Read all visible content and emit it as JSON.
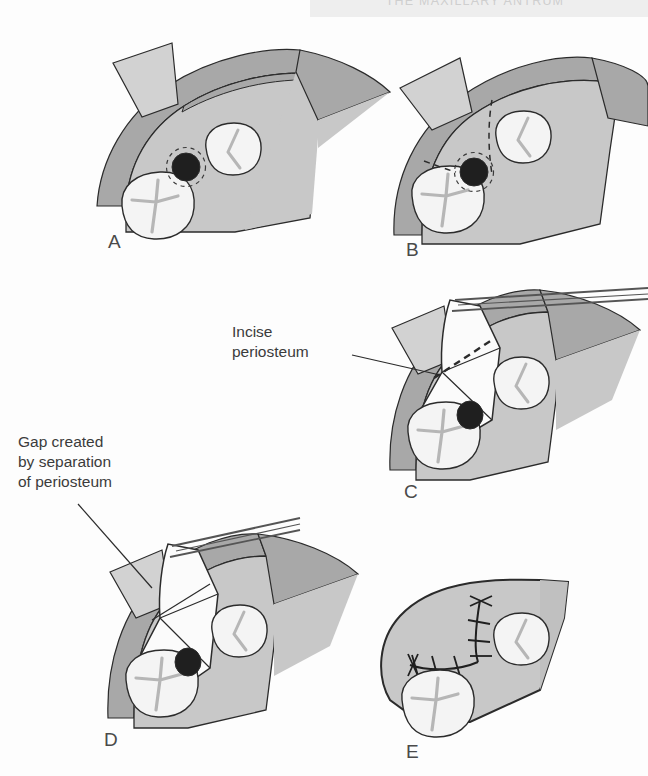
{
  "page": {
    "running_header": "THE MAXILLARY ANTRUM",
    "background_color": "#fdfdfd"
  },
  "colors": {
    "mucosa_light": "#cccccc",
    "mucosa_mid": "#c2c2c2",
    "band_dark": "#a8a8a8",
    "flap_white": "#fbfbfb",
    "tooth_white": "#f4f4f4",
    "socket_dark": "#1f1f1f",
    "outline": "#2b2b2b",
    "instrument": "#555555",
    "text": "#3b3b3b",
    "letter": "#4a4a4a",
    "header_text": "#cfcfcf"
  },
  "figure": {
    "caption_subject": "Buccal advancement flap closure of an oro-antral communication",
    "panels": [
      {
        "id": "A",
        "letter": "A",
        "description": "Oro-antral communication in the edentulous first molar socket, outlined by a dashed circle",
        "features": [
          "alveolar ridge",
          "second molar",
          "premolar",
          "dark socket defect",
          "dashed margin"
        ]
      },
      {
        "id": "B",
        "letter": "B",
        "description": "Planned incision lines drawn as dashed relieving incisions around the defect",
        "features": [
          "vertical relieving incision",
          "mesial relieving incision",
          "dark socket defect"
        ]
      },
      {
        "id": "C",
        "letter": "C",
        "label": "Incise\nperiosteum",
        "description": "Buccal flap raised and held with tissue forceps; dashed line marks the periosteal incision",
        "features": [
          "raised mucoperiosteal flap",
          "tissue forceps",
          "dashed periosteal incision line"
        ]
      },
      {
        "id": "D",
        "letter": "D",
        "label": "Gap created\nby separation\nof periosteum",
        "description": "Periosteum divided so the flap lengthens; the gap created is indicated by the leader line",
        "features": [
          "advanced flap",
          "tissue forceps",
          "periosteal gap"
        ]
      },
      {
        "id": "E",
        "letter": "E",
        "description": "Flap advanced over the defect and closed with interrupted sutures in an L-shaped line",
        "features": [
          "sutured flap",
          "interrupted sutures",
          "second molar",
          "premolar"
        ]
      }
    ]
  },
  "annotations": [
    {
      "id": "incise-periosteum",
      "text": "Incise\nperiosteum",
      "panel": "C"
    },
    {
      "id": "gap-periosteum",
      "text": "Gap created\nby separation\nof periosteum",
      "panel": "D"
    }
  ]
}
